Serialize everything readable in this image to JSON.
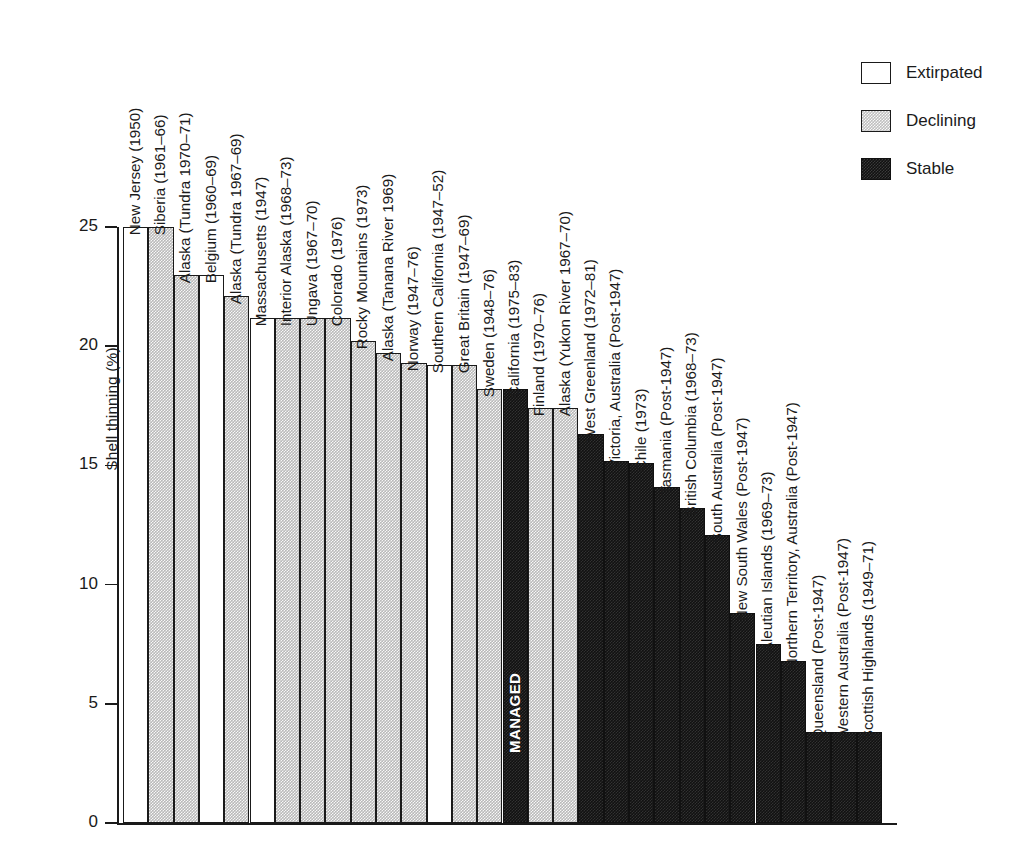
{
  "chart_data": {
    "type": "bar",
    "title": "",
    "xlabel": "",
    "ylabel": "Shell thinning (%)",
    "ylim": [
      0,
      25
    ],
    "yticks": [
      0,
      5,
      10,
      15,
      20,
      25
    ],
    "ytick_labels": [
      "0",
      "5",
      "10",
      "15",
      "20",
      "25"
    ],
    "grid": false,
    "legend_position": "top-right",
    "legend": [
      {
        "key": "extirpated",
        "label": "Extirpated",
        "color": "#ffffff"
      },
      {
        "key": "declining",
        "label": "Declining",
        "color": "#bfbfbf"
      },
      {
        "key": "stable",
        "label": "Stable",
        "color": "#111111"
      }
    ],
    "annotations": [
      {
        "text": "MANAGED",
        "on_category": "California (1975–83)",
        "orientation": "vertical",
        "color": "#ffffff"
      }
    ],
    "categories": [
      "New Jersey (1950)",
      "Siberia (1961–66)",
      "Alaska (Tundra 1970–71)",
      "Belgium (1960–69)",
      "Alaska (Tundra 1967–69)",
      "Massachusetts (1947)",
      "Interior Alaska (1968–73)",
      "Ungava (1967–70)",
      "Colorado (1976)",
      "Rocky Mountains (1973)",
      "Alaska (Tanana River 1969)",
      "Norway (1947–76)",
      "Southern California (1947–52)",
      "Great Britain (1947–69)",
      "Sweden (1948–76)",
      "California (1975–83)",
      "Finland (1970–76)",
      "Alaska (Yukon River 1967–70)",
      "West Greenland (1972–81)",
      "Victoria, Australia (Post-1947)",
      "Chile (1973)",
      "Tasmania (Post-1947)",
      "British Columbia (1968–73)",
      "South Australia (Post-1947)",
      "New South Wales (Post-1947)",
      "Aleutian Islands (1969–73)",
      "Northern Territory, Australia (Post-1947)",
      "Queensland (Post-1947)",
      "Western Australia (Post-1947)",
      "Scottish Highlands (1949–71)"
    ],
    "values": [
      25.0,
      25.0,
      23.0,
      23.0,
      22.1,
      21.2,
      21.2,
      21.2,
      21.2,
      20.2,
      19.7,
      19.3,
      19.2,
      19.2,
      18.2,
      18.2,
      17.4,
      17.4,
      16.3,
      15.2,
      15.1,
      14.1,
      13.2,
      12.1,
      8.8,
      7.5,
      6.8,
      3.8,
      3.8,
      3.8
    ],
    "status": [
      "extirpated",
      "declining",
      "declining",
      "extirpated",
      "declining",
      "extirpated",
      "declining",
      "declining",
      "declining",
      "declining",
      "declining",
      "declining",
      "extirpated",
      "declining",
      "declining",
      "stable",
      "declining",
      "declining",
      "stable",
      "stable",
      "stable",
      "stable",
      "stable",
      "stable",
      "stable",
      "stable",
      "stable",
      "stable",
      "stable",
      "stable"
    ]
  }
}
